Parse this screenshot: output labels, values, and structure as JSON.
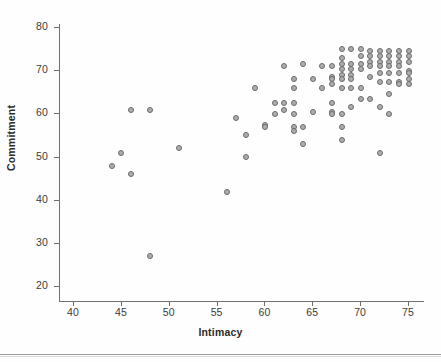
{
  "chart_data": {
    "type": "scatter",
    "title": "",
    "xlabel": "Intimacy",
    "ylabel": "Commitment",
    "xlim": [
      38,
      77
    ],
    "ylim": [
      18,
      83
    ],
    "xticks": [
      40,
      45,
      50,
      55,
      60,
      65,
      70,
      75
    ],
    "yticks": [
      20,
      30,
      40,
      50,
      60,
      70,
      80
    ],
    "grid": false,
    "legend": null,
    "marker": {
      "shape": "circle-open",
      "fill_color": "#adadad",
      "edge_color": "#6b6b6b",
      "size_px": 4
    },
    "points": [
      [
        44,
        48
      ],
      [
        45,
        51
      ],
      [
        46,
        46
      ],
      [
        46,
        61
      ],
      [
        48,
        61
      ],
      [
        48,
        27
      ],
      [
        51,
        52
      ],
      [
        56,
        42
      ],
      [
        57,
        59
      ],
      [
        58,
        55
      ],
      [
        58,
        50
      ],
      [
        59,
        66
      ],
      [
        60,
        57.5
      ],
      [
        60,
        57
      ],
      [
        61,
        62.5
      ],
      [
        61,
        60
      ],
      [
        62,
        71
      ],
      [
        62,
        62.5
      ],
      [
        62,
        61
      ],
      [
        63,
        68
      ],
      [
        63,
        66
      ],
      [
        63,
        62.5
      ],
      [
        63,
        60
      ],
      [
        63,
        57
      ],
      [
        63,
        56
      ],
      [
        64,
        71.5
      ],
      [
        64,
        57
      ],
      [
        64,
        53
      ],
      [
        65,
        68
      ],
      [
        65,
        60.5
      ],
      [
        66,
        71
      ],
      [
        66,
        66
      ],
      [
        67,
        71
      ],
      [
        67,
        68.5
      ],
      [
        67,
        68
      ],
      [
        67,
        67
      ],
      [
        67,
        62.5
      ],
      [
        67,
        60.5
      ],
      [
        67,
        60
      ],
      [
        68,
        75
      ],
      [
        68,
        73
      ],
      [
        68,
        71.5
      ],
      [
        68,
        70.5
      ],
      [
        68,
        69
      ],
      [
        68,
        68
      ],
      [
        68,
        66
      ],
      [
        68,
        60
      ],
      [
        68,
        57
      ],
      [
        68,
        54
      ],
      [
        69,
        75
      ],
      [
        69,
        71.5
      ],
      [
        69,
        70.5
      ],
      [
        69,
        69
      ],
      [
        69,
        68
      ],
      [
        69,
        66
      ],
      [
        69,
        61.5
      ],
      [
        70,
        75
      ],
      [
        70,
        73.5
      ],
      [
        70,
        71.5
      ],
      [
        70,
        70.5
      ],
      [
        70,
        66
      ],
      [
        70,
        63.5
      ],
      [
        71,
        74.5
      ],
      [
        71,
        73.5
      ],
      [
        71,
        72
      ],
      [
        71,
        71
      ],
      [
        71,
        68.5
      ],
      [
        71,
        63.5
      ],
      [
        72,
        74.5
      ],
      [
        72,
        73.5
      ],
      [
        72,
        72
      ],
      [
        72,
        71
      ],
      [
        72,
        69.5
      ],
      [
        72,
        67.5
      ],
      [
        72,
        61.5
      ],
      [
        72,
        51
      ],
      [
        73,
        74.5
      ],
      [
        73,
        73.5
      ],
      [
        73,
        72
      ],
      [
        73,
        71
      ],
      [
        73,
        69.5
      ],
      [
        73,
        67.5
      ],
      [
        73,
        64.5
      ],
      [
        73,
        60
      ],
      [
        74,
        74.5
      ],
      [
        74,
        73.5
      ],
      [
        74,
        72
      ],
      [
        74,
        71
      ],
      [
        74,
        69.5
      ],
      [
        74,
        67.5
      ],
      [
        74,
        67
      ],
      [
        75,
        74.5
      ],
      [
        75,
        73.5
      ],
      [
        75,
        72
      ],
      [
        75,
        70
      ],
      [
        75,
        69.5
      ],
      [
        75,
        68
      ],
      [
        75,
        67
      ]
    ]
  }
}
